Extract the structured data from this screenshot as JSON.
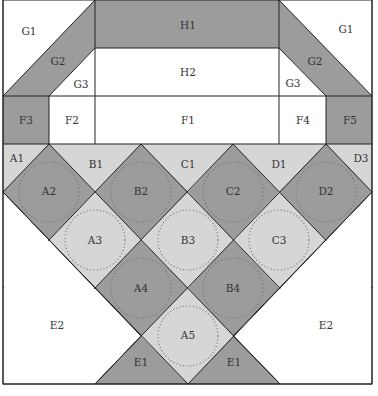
{
  "diagram": {
    "colors": {
      "dark": "#9c9c9c",
      "light": "#d6d6d6",
      "white": "#ffffff",
      "line": "#222222"
    },
    "labels": {
      "G1_left": "G1",
      "G1_right": "G1",
      "G2_left": "G2",
      "G2_right": "G2",
      "G3_left": "G3",
      "G3_right": "G3",
      "H1": "H1",
      "H2": "H2",
      "F1": "F1",
      "F2": "F2",
      "F3": "F3",
      "F4": "F4",
      "F5": "F5",
      "A1": "A1",
      "B1": "B1",
      "C1": "C1",
      "D1": "D1",
      "D3": "D3",
      "A2": "A2",
      "B2": "B2",
      "C2": "C2",
      "D2": "D2",
      "A3": "A3",
      "B3": "B3",
      "C3": "C3",
      "A4": "A4",
      "B4": "B4",
      "A5": "A5",
      "E1_left": "E1",
      "E1_right": "E1",
      "E2_left": "E2",
      "E2_right": "E2"
    }
  }
}
